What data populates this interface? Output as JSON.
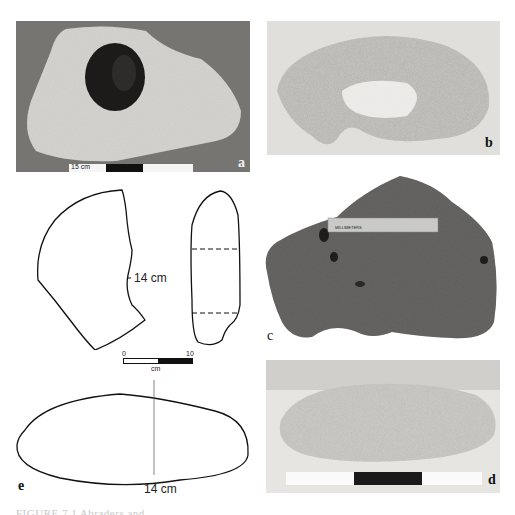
{
  "figure": {
    "panels": [
      {
        "id": "a",
        "label": "a",
        "type": "photo",
        "description": "pale stone slab with circular hole",
        "scale_bar_label": "15 cm"
      },
      {
        "id": "b",
        "label": "b",
        "type": "photo",
        "description": "pale porous stone fragment, crescent shaped"
      },
      {
        "id": "c",
        "label": "c",
        "type": "photo",
        "description": "dark porous stone with ruler",
        "ruler_label": "MILLIMETERS",
        "ruler_ticks": [
          "10",
          "20",
          "30",
          "40",
          "50",
          "60",
          "70",
          "80",
          "90",
          "100"
        ]
      },
      {
        "id": "d",
        "label": "d",
        "type": "photo",
        "description": "elongated oval pale stone with scale bar"
      },
      {
        "id": "e",
        "label": "e",
        "type": "drawing",
        "description": "outline drawing of oval stone",
        "dimension_label": "14 cm"
      }
    ],
    "drawing_top": {
      "dimension_label": "14 cm",
      "scale_bar": {
        "min_label": "0",
        "max_label": "10",
        "unit_label": "cm"
      }
    },
    "caption_truncated": "FIGURE 7.1 Abraders and ..."
  }
}
